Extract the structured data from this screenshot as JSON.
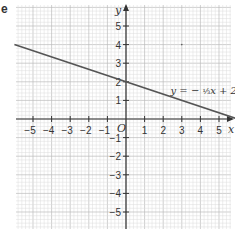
{
  "panel_label": "e",
  "chart_data": {
    "type": "line",
    "title": "",
    "xlabel": "x",
    "ylabel": "y",
    "origin_label": "O",
    "xlim": [
      -6,
      6
    ],
    "ylim": [
      -6,
      6
    ],
    "grid": true,
    "x_ticks": [
      -5,
      -4,
      -3,
      -2,
      -1,
      1,
      2,
      3,
      4,
      5
    ],
    "y_ticks": [
      -5,
      -4,
      -3,
      -2,
      -1,
      1,
      2,
      3,
      4,
      5
    ],
    "series": [
      {
        "name": "y = -1/3 x + 2",
        "equation": "y = − 1/3 x + 2",
        "slope": -0.3333,
        "intercept": 2,
        "x": [
          -6,
          6
        ],
        "values": [
          4,
          0
        ],
        "color": "#555555"
      }
    ],
    "annotations": [
      {
        "text": "y = − ⅓x + 2",
        "x": 2.5,
        "y": 1.5
      }
    ]
  }
}
